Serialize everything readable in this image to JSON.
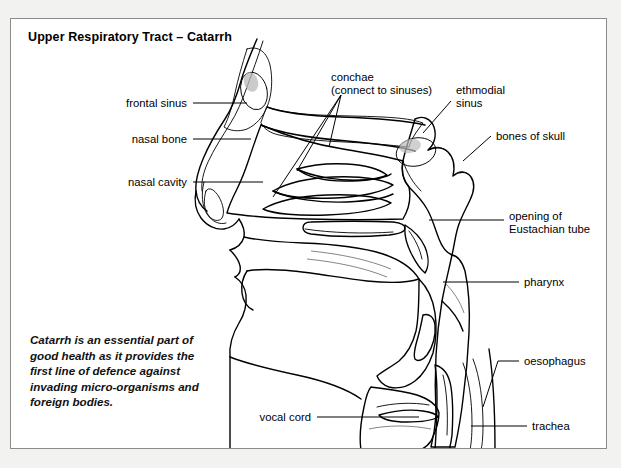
{
  "panel": {
    "title": "Upper Respiratory Tract – Catarrh",
    "background_color": "#ffffff",
    "border_color": "#8c8c8c",
    "page_background_color": "#f2f2f0"
  },
  "caption": {
    "text": "Catarrh is an essential part of good health as it provides the first line of defence against invading micro-organisms and foreign bodies."
  },
  "figure": {
    "type": "anatomical-cross-section",
    "colors": {
      "mucosa_fill": "#9a9a9a",
      "sinus_dark_fill": "#6e6e6e",
      "bone_fill": "#ffffff",
      "outline": "#000000",
      "leader_line": "#000000"
    },
    "labels": [
      {
        "id": "frontal-sinus",
        "text": "frontal sinus",
        "side": "left",
        "x": 176,
        "y": 88,
        "anchor": "end",
        "leader": "M182,84 L236,84"
      },
      {
        "id": "nasal-bone",
        "text": "nasal bone",
        "side": "left",
        "x": 176,
        "y": 124,
        "anchor": "end",
        "leader": "M182,120 L240,120"
      },
      {
        "id": "nasal-cavity",
        "text": "nasal cavity",
        "side": "left",
        "x": 176,
        "y": 167,
        "anchor": "end",
        "leader": "M182,163 L252,163"
      },
      {
        "id": "conchae",
        "text": "conchae",
        "line2": "(connect to sinuses)",
        "side": "top",
        "x": 320,
        "y": 62,
        "anchor": "start",
        "leader": "M330,76 L286,152 M330,76 L318,128 M330,76 L262,178"
      },
      {
        "id": "ethmodial-sinus",
        "text": "ethmodial",
        "line2": "sinus",
        "side": "right",
        "x": 445,
        "y": 75,
        "anchor": "start",
        "leader": "M440,82 L412,114"
      },
      {
        "id": "bones-of-skull",
        "text": "bones of skull",
        "side": "right",
        "x": 485,
        "y": 121,
        "anchor": "start",
        "leader": "M480,117 L452,142"
      },
      {
        "id": "opening-of-eustachian-tube",
        "text": "opening of",
        "line2": "Eustachian tube",
        "side": "right",
        "x": 498,
        "y": 201,
        "anchor": "start",
        "leader": "M493,201 L418,201"
      },
      {
        "id": "pharynx",
        "text": "pharynx",
        "side": "right",
        "x": 513,
        "y": 267,
        "anchor": "start",
        "leader": "M508,263 L432,263"
      },
      {
        "id": "oesophagus",
        "text": "oesophagus",
        "side": "right",
        "x": 513,
        "y": 346,
        "anchor": "start",
        "leader": "M508,342 L487,342 L472,386"
      },
      {
        "id": "vocal-cord",
        "text": "vocal cord",
        "side": "bottom",
        "x": 300,
        "y": 402,
        "anchor": "end",
        "leader": "M306,398 L408,398"
      },
      {
        "id": "trachea",
        "text": "trachea",
        "side": "right",
        "x": 521,
        "y": 411,
        "anchor": "start",
        "leader": "M516,407 L460,407"
      }
    ]
  }
}
